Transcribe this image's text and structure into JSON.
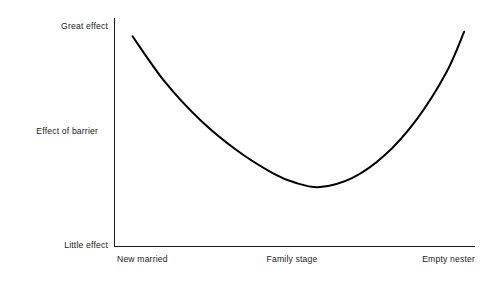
{
  "chart_data": {
    "type": "line",
    "title": "",
    "subtitle": "",
    "xlabel": "Family stage",
    "ylabel": "Effect of barrier",
    "grid": false,
    "legend": "none",
    "axis": {
      "y_top_label": "Great effect",
      "y_bottom_label": "Little effect",
      "y_axis_title": "Effect of barrier",
      "x_tick_labels": [
        "New married",
        "Family stage",
        "Empty nester"
      ],
      "xlim": [
        0,
        1
      ],
      "ylim": [
        0,
        1
      ]
    },
    "categories": [
      "New married",
      "Family stage",
      "Empty nester"
    ],
    "series": [
      {
        "name": "Effect of barrier",
        "color": "#000000",
        "shape": "u-curve",
        "x": [
          0.05,
          0.14,
          0.24,
          0.34,
          0.44,
          0.5,
          0.57,
          0.66,
          0.75,
          0.84,
          0.92,
          0.97
        ],
        "values": [
          0.92,
          0.72,
          0.55,
          0.42,
          0.32,
          0.28,
          0.26,
          0.3,
          0.4,
          0.56,
          0.76,
          0.94
        ],
        "annotations": [
          "Curve is U-shaped: high effect at New married, minimum near Family stage, high effect again at Empty nester"
        ]
      }
    ]
  },
  "labels": {
    "y_top": "Great effect",
    "y_title": "Effect of barrier",
    "y_bottom": "Little effect",
    "x_left": "New married",
    "x_mid": "Family stage",
    "x_right": "Empty nester"
  },
  "colors": {
    "background": "#ffffff",
    "axis": "#1b1b1b",
    "curve": "#000000",
    "text": "#1a1a1a"
  }
}
